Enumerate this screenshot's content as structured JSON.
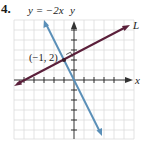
{
  "problem_number": "4.",
  "labels": {
    "blue_line": "y = −2x",
    "y_axis": "y",
    "x_axis": "x",
    "line_L": "L",
    "point": "(−1, 2)"
  },
  "colors": {
    "grid": "#dcdcdc",
    "axis": "#333333",
    "line_L": "#5a1f3a",
    "line_blue": "#5a8fb8"
  },
  "graph": {
    "grid_x_range": [
      -6,
      6
    ],
    "grid_y_range": [
      -6,
      6
    ],
    "lines": [
      {
        "name": "L",
        "slope": 0.5,
        "intercept": 2.5,
        "through": [
          -1,
          2
        ]
      },
      {
        "name": "y = -2x",
        "slope": -2,
        "intercept": 0
      }
    ],
    "marked_point": [
      -1,
      2
    ],
    "right_angle_marker": true
  }
}
